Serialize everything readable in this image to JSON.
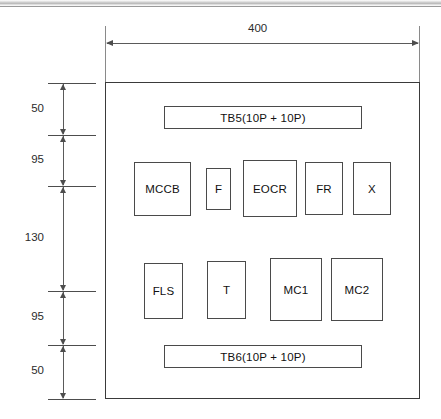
{
  "drawing": {
    "title": "Control panel component layout",
    "units": "mm",
    "line_color": "#4a4a4a",
    "background": "#ffffff"
  },
  "dimensions": {
    "width_overall": {
      "label": "400",
      "orientation": "horizontal",
      "position": "top"
    },
    "height_chain": {
      "orientation": "vertical",
      "position": "left",
      "segments": [
        {
          "label": "50"
        },
        {
          "label": "95"
        },
        {
          "label": "130"
        },
        {
          "label": "95"
        },
        {
          "label": "50"
        }
      ]
    }
  },
  "panel": {
    "terminal_blocks": [
      {
        "label": "TB5(10P + 10P)",
        "position": "top"
      },
      {
        "label": "TB6(10P + 10P)",
        "position": "bottom"
      }
    ],
    "rows": [
      {
        "row": "upper",
        "components": [
          {
            "label": "MCCB"
          },
          {
            "label": "F"
          },
          {
            "label": "EOCR"
          },
          {
            "label": "FR"
          },
          {
            "label": "X"
          }
        ]
      },
      {
        "row": "lower",
        "components": [
          {
            "label": "FLS"
          },
          {
            "label": "T"
          },
          {
            "label": "MC1"
          },
          {
            "label": "MC2"
          }
        ]
      }
    ]
  }
}
